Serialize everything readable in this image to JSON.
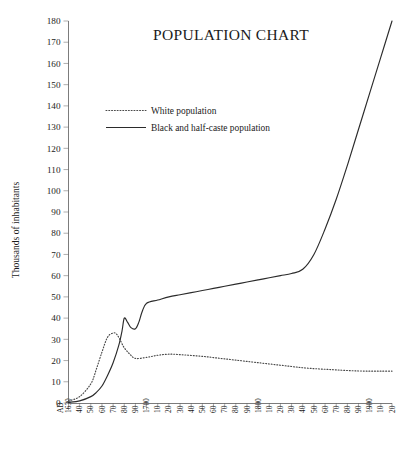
{
  "chart_data": {
    "type": "line",
    "title": "POPULATION CHART",
    "xlabel": "",
    "ylabel": "Thousands of inhabitants",
    "xlim": [
      1630,
      1920
    ],
    "ylim": [
      0,
      180
    ],
    "grid": false,
    "legend_position": "upper-left-inside",
    "y_ticks": [
      0,
      10,
      20,
      30,
      40,
      50,
      60,
      70,
      80,
      90,
      100,
      110,
      120,
      130,
      140,
      150,
      160,
      170,
      180
    ],
    "y_tick_labels": [
      "0",
      "10",
      "20",
      "30",
      "40",
      "50",
      "60",
      "70",
      "80",
      "90",
      "100",
      "110",
      "120",
      "130",
      "140",
      "150",
      "160",
      "170",
      "180"
    ],
    "x_ticks": [
      1630,
      1640,
      1650,
      1660,
      1670,
      1680,
      1690,
      1700,
      1710,
      1720,
      1730,
      1740,
      1750,
      1760,
      1770,
      1780,
      1790,
      1800,
      1810,
      1820,
      1830,
      1840,
      1850,
      1860,
      1870,
      1880,
      1890,
      1900,
      1910,
      1920
    ],
    "x_tick_labels": [
      "AD 1630",
      "40",
      "50",
      "60",
      "70",
      "80",
      "90",
      "1700",
      "10",
      "20",
      "30",
      "40",
      "50",
      "60",
      "70",
      "80",
      "90",
      "1800",
      "10",
      "20",
      "30",
      "40",
      "50",
      "60",
      "70",
      "80",
      "90",
      "1900",
      "10",
      "20"
    ],
    "series": [
      {
        "name": "White population",
        "style": "dotted",
        "color": "#4a4a4a",
        "x": [
          1630,
          1640,
          1650,
          1655,
          1660,
          1665,
          1670,
          1673,
          1676,
          1680,
          1685,
          1690,
          1700,
          1710,
          1720,
          1730,
          1740,
          1750,
          1760,
          1770,
          1780,
          1790,
          1800,
          1810,
          1820,
          1830,
          1840,
          1850,
          1860,
          1870,
          1880,
          1890,
          1900,
          1910,
          1920
        ],
        "values": [
          1,
          3,
          9,
          16,
          24,
          31,
          33,
          32.5,
          30,
          26,
          23,
          21,
          21.5,
          22.5,
          23,
          22.8,
          22.4,
          22,
          21.4,
          20.8,
          20.2,
          19.6,
          19,
          18.4,
          17.8,
          17.2,
          16.6,
          16.2,
          15.9,
          15.6,
          15.3,
          15.1,
          15,
          15,
          15
        ]
      },
      {
        "name": "Black and half-caste population",
        "style": "solid",
        "color": "#2b2b2b",
        "x": [
          1630,
          1640,
          1650,
          1655,
          1660,
          1665,
          1670,
          1675,
          1678,
          1680,
          1683,
          1686,
          1690,
          1693,
          1696,
          1700,
          1710,
          1720,
          1730,
          1740,
          1750,
          1760,
          1770,
          1780,
          1790,
          1800,
          1810,
          1820,
          1830,
          1840,
          1850,
          1860,
          1870,
          1880,
          1890,
          1900,
          1910,
          1920
        ],
        "values": [
          0.3,
          1,
          3,
          5,
          8,
          13,
          19,
          27,
          34,
          40,
          38,
          35.5,
          35,
          38,
          43,
          47,
          48.5,
          50,
          51,
          52,
          53,
          54,
          55,
          56,
          57,
          58,
          59,
          60,
          61,
          63,
          70,
          82,
          96,
          112,
          129,
          146,
          163,
          180
        ]
      }
    ],
    "legend_entries": [
      {
        "label": "White population",
        "style": "dotted"
      },
      {
        "label": "Black and half-caste population",
        "style": "solid"
      }
    ]
  }
}
